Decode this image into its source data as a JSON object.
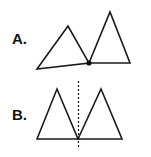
{
  "figure": {
    "panels": [
      {
        "label": "A.",
        "description": "Two triangles joined at a single shared vertex (marked with a dot)",
        "triangles": [
          {
            "points": [
              [
                37,
                69
              ],
              [
                68,
                26
              ],
              [
                89,
                63
              ]
            ]
          },
          {
            "points": [
              [
                89,
                63
              ],
              [
                110,
                12
              ],
              [
                130,
                63
              ]
            ]
          }
        ],
        "joint_point": [
          89,
          63
        ]
      },
      {
        "label": "B.",
        "description": "Two mirror-image triangles reflected across a dashed vertical line",
        "triangles": [
          {
            "points": [
              [
                37,
                139
              ],
              [
                57,
                89
              ],
              [
                78,
                139
              ]
            ]
          },
          {
            "points": [
              [
                78,
                139
              ],
              [
                101,
                89
              ],
              [
                122,
                139
              ]
            ]
          }
        ],
        "symmetry_line": {
          "x": 78.5,
          "y1": 81,
          "y2": 149
        }
      }
    ],
    "colors": {
      "stroke": "#1a1a1a",
      "background": "#ffffff"
    }
  }
}
